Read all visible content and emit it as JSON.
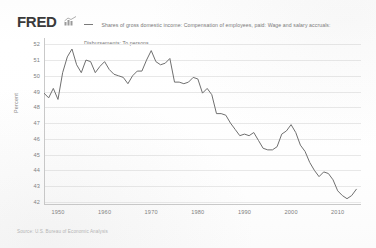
{
  "header": {
    "brand": "FRED",
    "brand_mark_icon": "mini-bar-chart-icon",
    "legend": {
      "swatch_icon": "legend-line-swatch",
      "label": "Shares of gross domestic income: Compensation of employees, paid: Wage and salary accruals: Disbursements: To persons"
    }
  },
  "footer": {
    "source": "Source: U.S. Bureau of Economic Analysis"
  },
  "chart_data": {
    "type": "line",
    "title": "",
    "xlabel": "",
    "ylabel": "Percent",
    "xlim": [
      1947,
      2015
    ],
    "ylim": [
      41.8,
      52.4
    ],
    "ytick_labels": [
      "52",
      "51",
      "50",
      "49",
      "48",
      "47",
      "46",
      "45",
      "44",
      "43",
      "42"
    ],
    "ytick_values": [
      52,
      51,
      50,
      49,
      48,
      47,
      46,
      45,
      44,
      43,
      42
    ],
    "xtick_labels": [
      "1950",
      "1960",
      "1970",
      "1980",
      "1990",
      "2000",
      "2010"
    ],
    "xtick_values": [
      1950,
      1960,
      1970,
      1980,
      1990,
      2000,
      2010
    ],
    "grid": true,
    "legend_position": "top",
    "line_color": "#6f6f6f",
    "grid_color": "#e8e8e8",
    "series": [
      {
        "name": "Shares of gross domestic income: Compensation of employees, paid: Wage and salary accruals: Disbursements: To persons",
        "x": [
          1947,
          1948,
          1949,
          1950,
          1951,
          1952,
          1953,
          1954,
          1955,
          1956,
          1957,
          1958,
          1959,
          1960,
          1961,
          1962,
          1963,
          1964,
          1965,
          1966,
          1967,
          1968,
          1969,
          1970,
          1971,
          1972,
          1973,
          1974,
          1975,
          1976,
          1977,
          1978,
          1979,
          1980,
          1981,
          1982,
          1983,
          1984,
          1985,
          1986,
          1987,
          1988,
          1989,
          1990,
          1991,
          1992,
          1993,
          1994,
          1995,
          1996,
          1997,
          1998,
          1999,
          2000,
          2001,
          2002,
          2003,
          2004,
          2005,
          2006,
          2007,
          2008,
          2009,
          2010,
          2011,
          2012,
          2013,
          2014
        ],
        "y": [
          48.9,
          48.6,
          49.2,
          48.5,
          50.2,
          51.2,
          51.7,
          50.7,
          50.2,
          51.0,
          50.9,
          50.2,
          50.6,
          50.9,
          50.4,
          50.1,
          50.0,
          49.9,
          49.5,
          50.0,
          50.3,
          50.3,
          51.0,
          51.6,
          50.9,
          50.7,
          50.8,
          51.1,
          49.6,
          49.6,
          49.5,
          49.6,
          49.9,
          49.8,
          48.9,
          49.2,
          48.8,
          47.6,
          47.6,
          47.5,
          47.0,
          46.6,
          46.2,
          46.3,
          46.2,
          46.4,
          45.9,
          45.4,
          45.3,
          45.3,
          45.5,
          46.3,
          46.5,
          46.9,
          46.4,
          45.6,
          45.2,
          44.5,
          44.0,
          43.6,
          43.9,
          43.8,
          43.4,
          42.7,
          42.4,
          42.2,
          42.4,
          42.8
        ]
      }
    ]
  }
}
